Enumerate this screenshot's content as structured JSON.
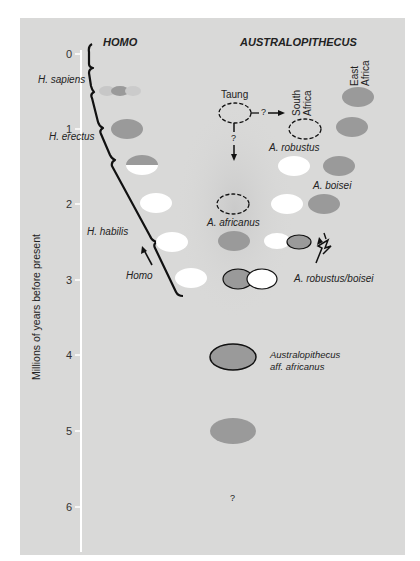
{
  "headers": {
    "homo": "HOMO",
    "australopithecus": "AUSTRALOPITHECUS"
  },
  "axis": {
    "label": "Millions of years before present",
    "ticks": [
      "0",
      "1",
      "2",
      "3",
      "4",
      "5",
      "6"
    ]
  },
  "region_labels": {
    "south_africa": "South Africa",
    "east_africa": "East Africa"
  },
  "taxa_labels": {
    "h_sapiens": "H. sapiens",
    "h_erectus": "H. erectus",
    "h_habilis": "H. habilis",
    "homo": "Homo",
    "taung": "Taung",
    "a_robustus": "A. robustus",
    "a_boisei": "A. boisei",
    "a_africanus": "A. africanus",
    "a_robustus_boisei": "A. robustus/boisei",
    "aff_africanus_line1": "Australopithecus",
    "aff_africanus_line2": "aff. africanus",
    "question_mark": "?",
    "arrow_q1": "?",
    "arrow_q2": "?"
  },
  "colors": {
    "panel": "#d9d9d8",
    "axis": "#ffffff",
    "fossil_grey": "#9a9a9a",
    "fossil_white": "#ffffff",
    "ink": "#111111"
  }
}
